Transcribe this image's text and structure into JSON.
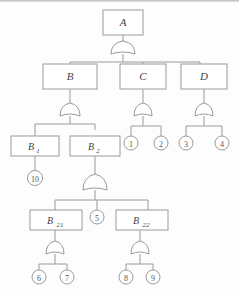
{
  "diagram": {
    "type": "fault-tree",
    "title": "",
    "colors": {
      "stroke": "#9a9a9a",
      "text": "#444444",
      "background": "#fdfdfd"
    },
    "nodes": {
      "A": {
        "label": "A",
        "kind": "box",
        "x": 123,
        "y": 22
      },
      "B": {
        "label": "B",
        "kind": "box",
        "x": 70,
        "y": 76
      },
      "C": {
        "label": "C",
        "kind": "box",
        "x": 143,
        "y": 76
      },
      "D": {
        "label": "D",
        "kind": "box",
        "x": 200,
        "y": 76
      },
      "B1": {
        "label": "B",
        "sub": "1",
        "kind": "box",
        "x": 35,
        "y": 143
      },
      "B2": {
        "label": "B",
        "sub": "2",
        "kind": "box",
        "x": 95,
        "y": 143
      },
      "B21": {
        "label": "B",
        "sub": "21",
        "kind": "box",
        "x": 55,
        "y": 217
      },
      "B22": {
        "label": "B",
        "sub": "22",
        "kind": "box",
        "x": 148,
        "y": 217
      },
      "E1": {
        "label": "1",
        "kind": "circle",
        "x": 131,
        "y": 143
      },
      "E2": {
        "label": "2",
        "kind": "circle",
        "x": 161,
        "y": 143
      },
      "E3": {
        "label": "3",
        "kind": "circle",
        "x": 186,
        "y": 143
      },
      "E4": {
        "label": "4",
        "kind": "circle",
        "x": 222,
        "y": 143
      },
      "E5": {
        "label": "5",
        "kind": "circle",
        "x": 97,
        "y": 217
      },
      "E6": {
        "label": "6",
        "kind": "circle",
        "x": 39,
        "y": 277
      },
      "E7": {
        "label": "7",
        "kind": "circle",
        "x": 67,
        "y": 277
      },
      "E8": {
        "label": "8",
        "kind": "circle",
        "x": 126,
        "y": 277
      },
      "E9": {
        "label": "9",
        "kind": "circle",
        "x": 153,
        "y": 277
      },
      "E10": {
        "label": "10",
        "kind": "circle",
        "x": 35,
        "y": 178
      }
    },
    "gates": [
      {
        "name": "gate-A",
        "type": "or",
        "x": 123,
        "y": 48,
        "parent": "A",
        "children": [
          "B",
          "C",
          "D"
        ]
      },
      {
        "name": "gate-B",
        "type": "or",
        "x": 70,
        "y": 110,
        "parent": "B",
        "children": [
          "B1",
          "B2"
        ]
      },
      {
        "name": "gate-C",
        "type": "or",
        "x": 143,
        "y": 110,
        "parent": "C",
        "children": [
          "E1",
          "E2"
        ]
      },
      {
        "name": "gate-D",
        "type": "or",
        "x": 204,
        "y": 110,
        "parent": "D",
        "children": [
          "E3",
          "E4"
        ]
      },
      {
        "name": "gate-B2",
        "type": "or",
        "x": 95,
        "y": 184,
        "parent": "B2",
        "children": [
          "B21",
          "E5",
          "B22"
        ]
      },
      {
        "name": "gate-B21",
        "type": "or",
        "x": 55,
        "y": 248,
        "parent": "B21",
        "children": [
          "E6",
          "E7"
        ]
      },
      {
        "name": "gate-B22",
        "type": "or",
        "x": 140,
        "y": 248,
        "parent": "B22",
        "children": [
          "E8",
          "E9"
        ]
      }
    ],
    "direct_links": [
      {
        "from": "B1",
        "to": "E10"
      }
    ]
  }
}
